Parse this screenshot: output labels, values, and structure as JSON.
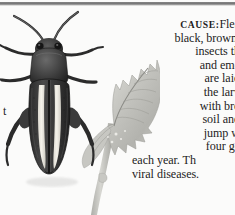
{
  "page": {
    "background_color": "#fbfbfa",
    "text_color": "#1d1d1d",
    "rule_color": "#6f6f6f"
  },
  "divider": {
    "name": "horizontal-rule"
  },
  "illustration": {
    "caption_alt": "flea beetle and chewed leaf",
    "subjects": [
      "flea-beetle",
      "serrated-leaf"
    ],
    "beetle": {
      "body_color": "#3a3a3a",
      "stripe_color": "#f1efe8",
      "description": "dark beetle with two pale longitudinal stripes on elytra, long antennae and enlarged hind legs"
    },
    "leaf": {
      "blade_color": "#c9c9c4",
      "vein_color": "#8f8f8a",
      "description": "toothed leaf with central midrib, lateral veins and a long petiole, edges shot-holed"
    }
  },
  "text": {
    "label": "CAUSE:",
    "lines": [
      "Flea",
      "black, brown,",
      "insects th",
      "and eme",
      "are laid",
      "the larv",
      "with bro",
      "soil and",
      "jump w",
      "four ge",
      "each year. Th",
      "viral diseases."
    ],
    "first_line_rest": "Flea",
    "clipped_right": true
  },
  "margin_fragments": {
    "left_letter": "t"
  }
}
